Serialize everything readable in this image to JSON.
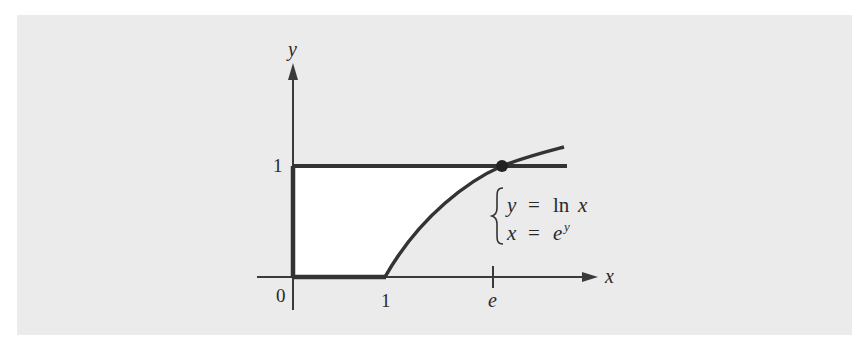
{
  "figure": {
    "axes": {
      "x_label": "x",
      "y_label": "y",
      "origin_label": "0",
      "x_ticks": [
        {
          "label": "1",
          "value": 1
        },
        {
          "label": "e",
          "value": 2.718
        }
      ],
      "y_ticks": [
        {
          "label": "1",
          "value": 1
        }
      ]
    },
    "curves": [
      {
        "name": "ln-curve",
        "equation": "y = ln x",
        "inverse": "x = e^y"
      },
      {
        "name": "horizontal-line",
        "equation": "y = 1"
      }
    ],
    "intersection_point": {
      "x": "e",
      "y": 1
    },
    "annotation": {
      "line1_lhs": "y",
      "line1_eq": "=",
      "line1_rhs": "ln x",
      "line2_lhs": "x",
      "line2_eq": "=",
      "line2_rhs_base": "e",
      "line2_rhs_exp": "y"
    },
    "shaded_region": "region bounded by y-axis, y=1, x-axis from 0 to 1, and y = ln x",
    "colors": {
      "background": "#ebebeb",
      "region_fill": "#ffffff",
      "stroke": "#333333"
    }
  }
}
